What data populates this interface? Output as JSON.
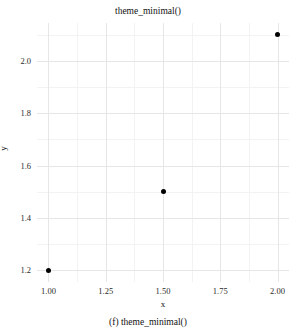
{
  "chart_data": {
    "type": "scatter",
    "title": "theme_minimal()",
    "caption": "(f) theme_minimal()",
    "xlabel": "x",
    "ylabel": "y",
    "x": [
      1.0,
      1.5,
      2.0
    ],
    "y": [
      1.2,
      1.5,
      2.1
    ],
    "points": [
      {
        "x": 1.0,
        "y": 1.2
      },
      {
        "x": 1.5,
        "y": 1.5
      },
      {
        "x": 2.0,
        "y": 2.1
      }
    ],
    "xlim": [
      0.95,
      2.05
    ],
    "ylim": [
      1.155,
      2.145
    ],
    "xticks": [
      1.0,
      1.25,
      1.5,
      1.75,
      2.0
    ],
    "xtick_labels": [
      "1.00",
      "1.25",
      "1.50",
      "1.75",
      "2.00"
    ],
    "yticks": [
      1.2,
      1.4,
      1.6,
      1.8,
      2.0
    ],
    "ytick_labels": [
      "1.2",
      "1.4",
      "1.6",
      "1.8",
      "2.0"
    ],
    "x_minor_ticks": [
      1.125,
      1.375,
      1.625,
      1.875
    ],
    "y_minor_ticks": [
      1.3,
      1.5,
      1.7,
      1.9,
      2.1
    ],
    "grid": true,
    "grid_major_color": "#e6e6e6",
    "grid_minor_color": "#f3f3f3",
    "point_color": "#000000",
    "background_color": "#ffffff",
    "panel_border": false,
    "legend": null,
    "legend_position": "none"
  }
}
